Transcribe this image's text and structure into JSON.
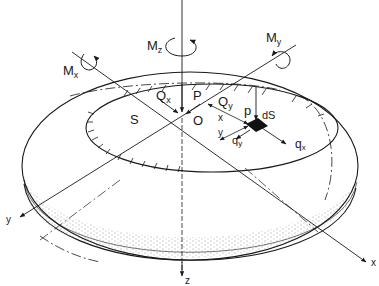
{
  "diagram": {
    "colors": {
      "ink": "#1a1a1a",
      "background": "#ffffff",
      "element": "#111111"
    },
    "labels": {
      "Mz": {
        "main": "M",
        "sub": "z"
      },
      "Mx": {
        "main": "M",
        "sub": "x"
      },
      "My": {
        "main": "M",
        "sub": "y"
      },
      "Qx": {
        "main": "Q",
        "sub": "x"
      },
      "Qy": {
        "main": "Q",
        "sub": "y"
      },
      "P_center": "P",
      "O": "O",
      "S": "S",
      "p_local": "p",
      "dS": "dS",
      "x_dim": "x",
      "y_dim": "y",
      "qx": {
        "main": "q",
        "sub": "x"
      },
      "qy": {
        "main": "q",
        "sub": "y"
      },
      "axis_x": "x",
      "axis_y": "y",
      "axis_z": "z"
    }
  }
}
